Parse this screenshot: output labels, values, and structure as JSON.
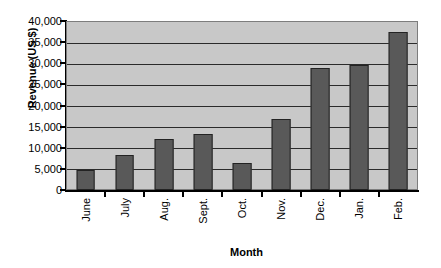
{
  "chart_data": {
    "type": "bar",
    "title": "",
    "xlabel": "Month",
    "ylabel": "Revenue (US $)",
    "categories": [
      "June",
      "July",
      "Aug.",
      "Sept.",
      "Oct.",
      "Nov.",
      "Dec.",
      "Jan.",
      "Feb."
    ],
    "values": [
      4800,
      8400,
      12000,
      13200,
      6400,
      16800,
      28800,
      29600,
      37400
    ],
    "ylim": [
      0,
      40000
    ],
    "ytick_values": [
      0,
      5000,
      10000,
      15000,
      20000,
      25000,
      30000,
      35000,
      40000
    ],
    "ytick_labels": [
      "0",
      "5,000",
      "10,000",
      "15,000",
      "20,000",
      "25,000",
      "30,000",
      "35,000",
      "40,000"
    ],
    "grid": true,
    "legend": false,
    "legend_position": "none",
    "bar_color": "#595959",
    "bar_edge_color": "#232323",
    "plot_background": "#c8c8c8",
    "gridline_color": "#2b2b2b",
    "axis_color": "#000000",
    "xlabel_rotation": 90
  }
}
